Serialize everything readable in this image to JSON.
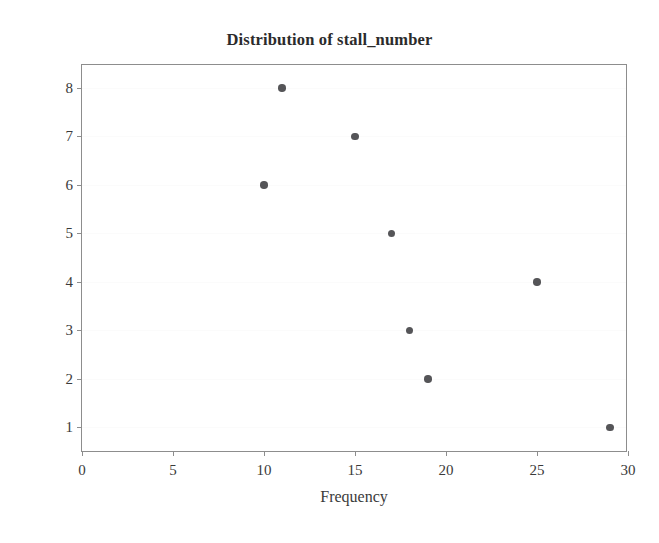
{
  "chart_data": {
    "type": "scatter",
    "title": "Distribution of stall_number",
    "xlabel": "Frequency",
    "ylabel": "stall_number",
    "xlim": [
      0,
      30
    ],
    "ylim": [
      0.47,
      8.47
    ],
    "xticks": [
      0,
      5,
      10,
      15,
      20,
      25,
      30
    ],
    "yticks": [
      1,
      2,
      3,
      4,
      5,
      6,
      7,
      8
    ],
    "grid": "faint-horizontal",
    "legend": "none",
    "marker_color": "#555558",
    "frame_color": "#8d8d8d",
    "background_color": "#ffffff",
    "x": [
      11,
      15,
      10,
      17,
      25,
      18,
      19,
      29
    ],
    "y": [
      8,
      7,
      6,
      5,
      4,
      3,
      2,
      1
    ],
    "points": [
      {
        "x": 11,
        "y": 8
      },
      {
        "x": 15,
        "y": 7
      },
      {
        "x": 10,
        "y": 6
      },
      {
        "x": 17,
        "y": 5
      },
      {
        "x": 25,
        "y": 4
      },
      {
        "x": 18,
        "y": 3
      },
      {
        "x": 19,
        "y": 2
      },
      {
        "x": 29,
        "y": 1
      }
    ]
  }
}
